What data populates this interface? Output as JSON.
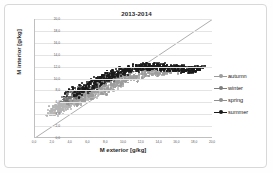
{
  "chart_data": {
    "type": "scatter",
    "title": "2013-2014",
    "xlabel": "M exterior [g/kg]",
    "ylabel": "M interior [g/kg]",
    "xlim": [
      0.0,
      20.0
    ],
    "ylim": [
      0.0,
      20.0
    ],
    "xticks": [
      "0,0",
      "2,0",
      "4,0",
      "6,0",
      "8,0",
      "10,0",
      "12,0",
      "14,0",
      "16,0",
      "18,0",
      "20,0"
    ],
    "yticks": [
      "0,0",
      "2,0",
      "4,0",
      "6,0",
      "8,0",
      "10,0",
      "12,0",
      "14,0",
      "16,0",
      "18,0",
      "20,0"
    ],
    "grid": "horizontal",
    "legend_position": "right",
    "reference_line": {
      "name": "identity-line",
      "from": [
        0.0,
        0.0
      ],
      "to": [
        20.0,
        20.0
      ],
      "color": "#8a8a8a"
    },
    "series": [
      {
        "name": "autumn",
        "color": "#9c9c9c",
        "marker": "circle",
        "points": [
          [
            4.2,
            5.8
          ],
          [
            4.6,
            6.1
          ],
          [
            5.0,
            6.4
          ],
          [
            5.4,
            6.7
          ],
          [
            5.8,
            7.0
          ],
          [
            6.2,
            7.3
          ],
          [
            6.6,
            7.6
          ],
          [
            7.0,
            7.9
          ],
          [
            7.4,
            8.2
          ],
          [
            7.8,
            8.5
          ],
          [
            8.2,
            8.8
          ],
          [
            8.6,
            9.0
          ],
          [
            9.0,
            9.3
          ],
          [
            9.4,
            9.5
          ],
          [
            9.8,
            9.8
          ],
          [
            10.2,
            10.0
          ],
          [
            10.6,
            10.2
          ],
          [
            11.0,
            10.4
          ],
          [
            11.4,
            10.5
          ],
          [
            11.8,
            10.7
          ],
          [
            12.2,
            10.8
          ],
          [
            12.6,
            11.0
          ],
          [
            13.0,
            11.1
          ],
          [
            13.4,
            11.2
          ],
          [
            13.8,
            11.3
          ],
          [
            14.2,
            11.3
          ],
          [
            14.6,
            11.4
          ],
          [
            15.0,
            11.4
          ],
          [
            5.2,
            6.0
          ],
          [
            6.0,
            6.8
          ],
          [
            6.8,
            7.2
          ],
          [
            7.6,
            7.8
          ],
          [
            8.4,
            8.4
          ],
          [
            9.2,
            8.9
          ],
          [
            10.0,
            9.4
          ],
          [
            10.8,
            9.9
          ],
          [
            11.6,
            10.3
          ],
          [
            12.4,
            10.6
          ],
          [
            13.2,
            10.9
          ],
          [
            14.0,
            11.1
          ],
          [
            14.8,
            11.2
          ],
          [
            15.6,
            11.3
          ]
        ]
      },
      {
        "name": "winter",
        "color": "#b4b4b4",
        "marker": "circle",
        "points": [
          [
            2.0,
            4.2
          ],
          [
            2.2,
            4.5
          ],
          [
            2.4,
            4.8
          ],
          [
            2.6,
            5.0
          ],
          [
            2.8,
            5.2
          ],
          [
            3.0,
            5.4
          ],
          [
            3.2,
            5.6
          ],
          [
            3.4,
            5.7
          ],
          [
            3.6,
            5.9
          ],
          [
            3.8,
            6.0
          ],
          [
            4.0,
            6.2
          ],
          [
            4.4,
            6.4
          ],
          [
            4.8,
            6.6
          ],
          [
            5.2,
            6.8
          ],
          [
            5.6,
            7.0
          ],
          [
            6.0,
            7.2
          ],
          [
            6.4,
            7.4
          ],
          [
            6.8,
            7.6
          ],
          [
            7.2,
            7.8
          ],
          [
            7.6,
            8.0
          ],
          [
            8.0,
            8.2
          ],
          [
            8.4,
            8.4
          ],
          [
            8.8,
            8.6
          ],
          [
            9.2,
            8.8
          ],
          [
            2.1,
            4.0
          ],
          [
            2.5,
            4.4
          ],
          [
            2.9,
            4.9
          ],
          [
            3.3,
            5.3
          ],
          [
            3.7,
            5.6
          ],
          [
            4.1,
            5.9
          ],
          [
            4.5,
            6.1
          ],
          [
            4.9,
            6.3
          ],
          [
            5.3,
            6.5
          ],
          [
            5.7,
            6.7
          ],
          [
            6.1,
            6.9
          ],
          [
            6.5,
            7.1
          ],
          [
            2.0,
            4.6
          ],
          [
            2.3,
            5.0
          ],
          [
            2.7,
            5.3
          ],
          [
            3.1,
            5.5
          ],
          [
            3.5,
            5.8
          ],
          [
            3.9,
            6.1
          ]
        ]
      },
      {
        "name": "spring",
        "color": "#6e6e6e",
        "marker": "circle",
        "points": [
          [
            3.6,
            6.4
          ],
          [
            4.0,
            6.8
          ],
          [
            4.4,
            7.2
          ],
          [
            4.8,
            7.6
          ],
          [
            5.2,
            7.9
          ],
          [
            5.6,
            8.2
          ],
          [
            6.0,
            8.5
          ],
          [
            6.4,
            8.8
          ],
          [
            6.8,
            9.0
          ],
          [
            7.2,
            9.3
          ],
          [
            7.6,
            9.5
          ],
          [
            8.0,
            9.7
          ],
          [
            8.4,
            9.9
          ],
          [
            8.8,
            10.1
          ],
          [
            9.2,
            10.3
          ],
          [
            9.6,
            10.5
          ],
          [
            10.0,
            10.6
          ],
          [
            3.8,
            6.2
          ],
          [
            4.2,
            6.6
          ],
          [
            4.6,
            7.0
          ],
          [
            5.0,
            7.4
          ],
          [
            5.4,
            7.7
          ],
          [
            5.8,
            8.0
          ],
          [
            6.2,
            8.3
          ],
          [
            6.6,
            8.6
          ],
          [
            7.0,
            8.9
          ],
          [
            7.4,
            9.1
          ],
          [
            7.8,
            9.4
          ],
          [
            8.2,
            9.6
          ]
        ]
      },
      {
        "name": "summer",
        "color": "#1a1a1a",
        "marker": "circle",
        "points": [
          [
            4.0,
            7.4
          ],
          [
            4.4,
            7.8
          ],
          [
            4.8,
            8.1
          ],
          [
            5.2,
            8.4
          ],
          [
            5.6,
            8.7
          ],
          [
            6.0,
            9.0
          ],
          [
            6.4,
            9.3
          ],
          [
            6.8,
            9.6
          ],
          [
            7.2,
            9.9
          ],
          [
            7.6,
            10.1
          ],
          [
            8.0,
            10.4
          ],
          [
            8.4,
            10.6
          ],
          [
            8.8,
            10.8
          ],
          [
            9.2,
            11.0
          ],
          [
            9.6,
            11.2
          ],
          [
            10.0,
            11.4
          ],
          [
            10.4,
            11.5
          ],
          [
            10.8,
            11.7
          ],
          [
            11.2,
            11.8
          ],
          [
            11.6,
            11.9
          ],
          [
            12.0,
            12.0
          ],
          [
            12.4,
            12.0
          ],
          [
            12.8,
            12.1
          ],
          [
            13.2,
            12.1
          ],
          [
            13.6,
            12.1
          ],
          [
            14.0,
            12.0
          ],
          [
            14.4,
            12.0
          ],
          [
            14.8,
            11.9
          ],
          [
            15.2,
            11.9
          ],
          [
            15.6,
            11.8
          ],
          [
            16.0,
            11.8
          ],
          [
            16.4,
            11.7
          ],
          [
            16.8,
            11.7
          ],
          [
            17.2,
            11.6
          ],
          [
            17.6,
            11.6
          ],
          [
            18.0,
            11.6
          ],
          [
            18.4,
            11.7
          ],
          [
            4.6,
            7.2
          ],
          [
            5.0,
            7.7
          ],
          [
            5.4,
            8.0
          ],
          [
            5.8,
            8.3
          ],
          [
            6.2,
            8.6
          ],
          [
            6.6,
            9.0
          ],
          [
            7.0,
            9.4
          ],
          [
            7.4,
            9.7
          ],
          [
            7.8,
            10.0
          ],
          [
            8.2,
            10.2
          ],
          [
            8.6,
            10.5
          ],
          [
            9.0,
            10.7
          ],
          [
            9.4,
            10.9
          ],
          [
            9.8,
            11.1
          ],
          [
            10.2,
            11.3
          ],
          [
            10.6,
            11.4
          ],
          [
            11.0,
            11.6
          ],
          [
            11.4,
            11.7
          ],
          [
            11.8,
            11.8
          ],
          [
            12.2,
            11.9
          ],
          [
            12.6,
            11.9
          ],
          [
            13.0,
            12.0
          ],
          [
            13.4,
            12.0
          ],
          [
            13.8,
            11.9
          ],
          [
            14.2,
            11.9
          ],
          [
            14.6,
            11.8
          ],
          [
            15.0,
            11.8
          ],
          [
            15.4,
            11.7
          ],
          [
            15.8,
            11.7
          ],
          [
            16.2,
            11.6
          ],
          [
            16.6,
            11.6
          ],
          [
            17.0,
            11.5
          ],
          [
            17.4,
            11.5
          ],
          [
            17.8,
            11.5
          ],
          [
            18.2,
            11.6
          ],
          [
            18.6,
            11.7
          ]
        ]
      }
    ]
  },
  "legend": {
    "entries": [
      {
        "label": "autumn",
        "color": "#9c9c9c"
      },
      {
        "label": "winter",
        "color": "#7d7d7d"
      },
      {
        "label": "spring",
        "color": "#8f8f8f"
      },
      {
        "label": "summer",
        "color": "#1a1a1a"
      }
    ]
  }
}
